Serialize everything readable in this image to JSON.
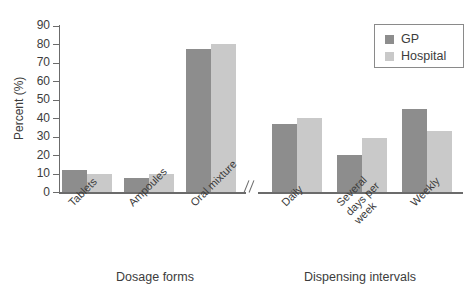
{
  "chart_data": {
    "type": "bar",
    "title": "",
    "subtitle": "",
    "xlabel": "",
    "ylabel": "Percent (%)",
    "ylim": [
      0,
      90
    ],
    "ytick_step": 10,
    "yticks": [
      0,
      10,
      20,
      30,
      40,
      50,
      60,
      70,
      80,
      90
    ],
    "ytick_labels": [
      "0",
      "10",
      "20",
      "30",
      "40",
      "50",
      "60",
      "70",
      "80",
      "90"
    ],
    "grid": false,
    "legend_position": "top-right",
    "axis_break": true,
    "axis_break_symbol": "//",
    "series": [
      {
        "name": "GP",
        "color": "#8d8d8d",
        "values": [
          12,
          7.5,
          77.5,
          37,
          20,
          45
        ]
      },
      {
        "name": "Hospital",
        "color": "#c9c9c9",
        "values": [
          9.5,
          9.5,
          80,
          40,
          29,
          33
        ]
      }
    ],
    "categories": [
      "Tablets",
      "Ampoules",
      "Oral mixture",
      "Daily",
      "Several days per week",
      "Weekly"
    ],
    "panels": [
      {
        "title": "Dosage forms",
        "categories": [
          "Tablets",
          "Ampoules",
          "Oral mixture"
        ],
        "series": [
          {
            "name": "GP",
            "values": [
              12,
              7.5,
              77.5
            ]
          },
          {
            "name": "Hospital",
            "values": [
              9.5,
              9.5,
              80
            ]
          }
        ]
      },
      {
        "title": "Dispensing intervals",
        "categories": [
          "Daily",
          "Several days per week",
          "Weekly"
        ],
        "series": [
          {
            "name": "GP",
            "values": [
              37,
              20,
              45
            ]
          },
          {
            "name": "Hospital",
            "values": [
              40,
              29,
              33
            ]
          }
        ]
      }
    ]
  },
  "axis": {
    "y_title": "Percent (%)",
    "ticks": [
      {
        "label": "90"
      },
      {
        "label": "80"
      },
      {
        "label": "70"
      },
      {
        "label": "60"
      },
      {
        "label": "50"
      },
      {
        "label": "40"
      },
      {
        "label": "30"
      },
      {
        "label": "20"
      },
      {
        "label": "10"
      },
      {
        "label": "0"
      }
    ]
  },
  "categories": [
    {
      "label": "Tablets"
    },
    {
      "label": "Ampoules"
    },
    {
      "label": "Oral mixture"
    },
    {
      "label": "Daily"
    },
    {
      "label": "Several"
    },
    {
      "label": "Weekly"
    }
  ],
  "several_lines": {
    "line1": "Several",
    "line2": "days per",
    "line3": "week"
  },
  "panel_titles": {
    "left": "Dosage forms",
    "right": "Dispensing intervals"
  },
  "legend": {
    "items": [
      {
        "label": "GP",
        "color": "#8d8d8d"
      },
      {
        "label": "Hospital",
        "color": "#c9c9c9"
      }
    ]
  },
  "colors": {
    "gp": "#8d8d8d",
    "hospital": "#c9c9c9",
    "axis": "#6b6b6b",
    "text": "#3c3c3c",
    "background": "#ffffff"
  }
}
